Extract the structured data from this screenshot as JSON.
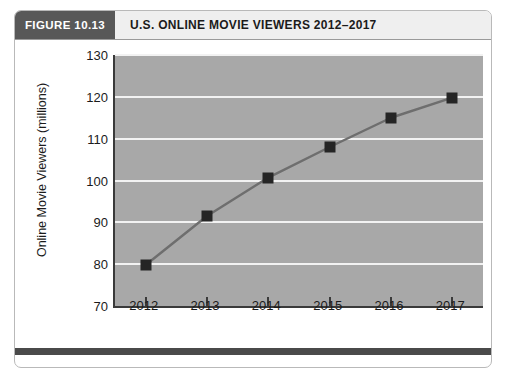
{
  "figure": {
    "number_label": "FIGURE 10.13",
    "title": "U.S. ONLINE MOVIE VIEWERS 2012–2017"
  },
  "chart_data": {
    "type": "line",
    "title": "U.S. ONLINE MOVIE VIEWERS 2012–2017",
    "xlabel": "",
    "ylabel": "Online Movie Viewers (millions)",
    "categories": [
      "2012",
      "2013",
      "2014",
      "2015",
      "2016",
      "2017"
    ],
    "values": [
      79.8,
      91.5,
      100.7,
      108.0,
      115.0,
      119.8
    ],
    "ylim": [
      70,
      130
    ],
    "yticks": [
      70,
      80,
      90,
      100,
      110,
      120,
      130
    ],
    "grid": true,
    "legend": null,
    "marker": "square",
    "colors": {
      "plot_background": "#a8a8a8",
      "gridline": "#f2f2f2",
      "line": "#6e6e6e",
      "marker": "#252525",
      "axis": "#3a3a3a",
      "header_number_bg": "#585858",
      "header_title_bg": "#efefef",
      "footer_rule": "#4a4a4a"
    }
  }
}
